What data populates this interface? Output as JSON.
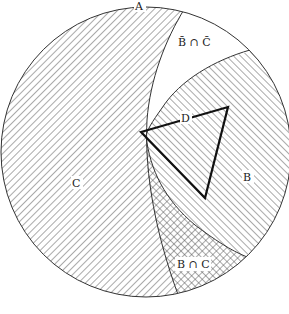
{
  "diagram": {
    "labels": {
      "universe": "A",
      "complement_intersection": "B̄ ∩ C̄",
      "triangle": "D",
      "set_c": "C",
      "set_b": "B",
      "intersection": "B ∩ C"
    },
    "colors": {
      "stroke": "#333333",
      "hatch": "#555555",
      "background": "#ffffff",
      "triangle": "#111111"
    },
    "regions": [
      {
        "name": "C",
        "pattern": "diagonal-forward-hatch"
      },
      {
        "name": "B",
        "pattern": "diagonal-back-hatch"
      },
      {
        "name": "B ∩ C",
        "pattern": "cross-hatch"
      },
      {
        "name": "B̄ ∩ C̄",
        "pattern": "none"
      }
    ]
  }
}
